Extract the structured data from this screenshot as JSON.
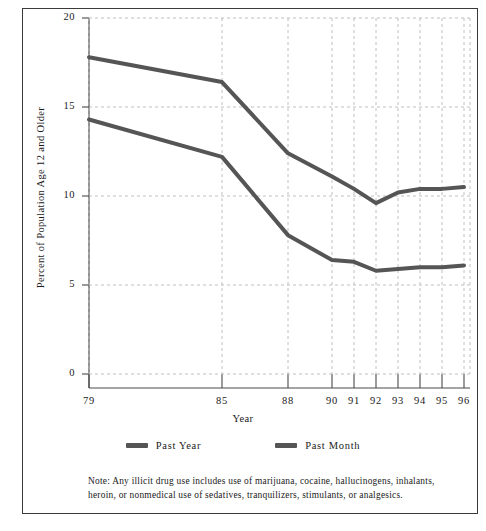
{
  "figure": {
    "note": "Note: Any illicit drug use includes use of marijuana, cocaine, hallucinogens, inhalants, heroin, or nonmedical use of sedatives, tranquilizers, stimulants, or analgesics."
  },
  "axes": {
    "y_title": "Percent of Population Age 12 and Older",
    "x_title": "Year",
    "y_ticks": [
      "0",
      "5",
      "10",
      "15",
      "20"
    ],
    "x_ticks": [
      "79",
      "85",
      "88",
      "90",
      "91",
      "92",
      "93",
      "94",
      "95",
      "96"
    ]
  },
  "legend": {
    "position": "bottom-center",
    "entries": [
      {
        "label": "Past Year",
        "color": "#555555"
      },
      {
        "label": "Past Month",
        "color": "#555555"
      }
    ]
  },
  "chart_data": {
    "type": "line",
    "title": "",
    "subtitle": "",
    "xlabel": "Year",
    "ylabel": "Percent of Population Age 12 and Older",
    "categories": [
      "79",
      "85",
      "88",
      "90",
      "91",
      "92",
      "93",
      "94",
      "95",
      "96"
    ],
    "x": [
      1979,
      1985,
      1988,
      1990,
      1991,
      1992,
      1993,
      1994,
      1995,
      1996
    ],
    "xlim": [
      1979,
      1996
    ],
    "ylim": [
      0,
      20
    ],
    "y_ticks": [
      0,
      5,
      10,
      15,
      20
    ],
    "grid": true,
    "grid_style": "dashed",
    "series": [
      {
        "name": "Past Year",
        "color": "#555555",
        "values": [
          17.8,
          16.4,
          12.4,
          11.1,
          10.4,
          9.6,
          10.2,
          10.4,
          10.4,
          10.5
        ]
      },
      {
        "name": "Past Month",
        "color": "#555555",
        "values": [
          14.3,
          12.2,
          7.8,
          6.4,
          6.3,
          5.8,
          5.9,
          6.0,
          6.0,
          6.1
        ]
      }
    ],
    "annotations": [
      "Note: Any illicit drug use includes use of marijuana, cocaine, hallucinogens, inhalants, heroin, or nonmedical use of sedatives, tranquilizers, stimulants, or analgesics."
    ]
  }
}
